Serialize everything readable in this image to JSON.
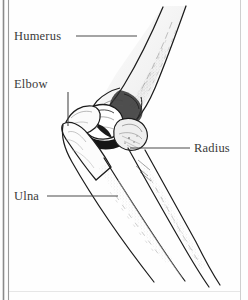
{
  "figure": {
    "kind": "anatomical-illustration",
    "style": "pen-and-ink line drawing",
    "ink_color": "#1c1c1c",
    "label_color": "#3a3a3a",
    "background_color": "#fefefe",
    "border": {
      "left_rule_color": "#7a7a7a",
      "left_rule_count": 2,
      "right_rule_color": "#c9c9c9",
      "bottom_rule_color": "#e2e2e2"
    }
  },
  "labels": {
    "humerus": "Humerus",
    "elbow": "Elbow",
    "ulna": "Ulna",
    "radius": "Radius"
  },
  "leader_lines": {
    "humerus": {
      "x1": 76,
      "y1": 36,
      "x2": 137,
      "y2": 36,
      "orientation": "horizontal"
    },
    "elbow": {
      "x1": 68,
      "y1": 92,
      "x2": 68,
      "y2": 126,
      "orientation": "vertical"
    },
    "ulna": {
      "x1": 47,
      "y1": 196,
      "x2": 118,
      "y2": 196,
      "orientation": "horizontal"
    },
    "radius": {
      "x1": 130,
      "y1": 148,
      "x2": 190,
      "y2": 148,
      "orientation": "horizontal"
    }
  },
  "bones": [
    {
      "name": "Humerus",
      "region": "upper arm",
      "orientation": "descends from upper-right to elbow"
    },
    {
      "name": "Radius",
      "region": "forearm lateral",
      "orientation": "descends to lower-right"
    },
    {
      "name": "Ulna",
      "region": "forearm medial",
      "orientation": "descends to lower-right"
    }
  ]
}
